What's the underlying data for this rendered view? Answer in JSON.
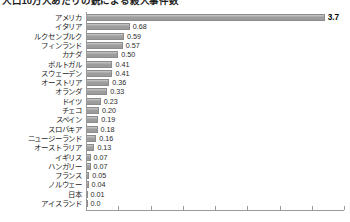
{
  "chart_data": {
    "type": "bar",
    "orientation": "horizontal",
    "title": "人口10万人あたりの銃による殺人事件数",
    "xlabel": "",
    "ylabel": "",
    "xlim": [
      0,
      4.0
    ],
    "grid": false,
    "legend": null,
    "axis_ticks": [
      "0.0",
      "0.5",
      "1.0",
      "1.5",
      "2.0",
      "2.5",
      "3.0",
      "3.5",
      "4.0"
    ],
    "highlight_category": "アメリカ",
    "bar_color": "#a3a3a3",
    "categories": [
      "アメリカ",
      "イタリア",
      "ルクセンブルク",
      "フィンランド",
      "カナダ",
      "ポルトガル",
      "スウェーデン",
      "オーストリア",
      "オランダ",
      "ドイツ",
      "チェコ",
      "スペイン",
      "スロバキア",
      "ニュージーランド",
      "オーストラリア",
      "イギリス",
      "ハンガリー",
      "フランス",
      "ノルウェー",
      "日本",
      "アイスランド"
    ],
    "values": [
      3.7,
      0.68,
      0.59,
      0.57,
      0.5,
      0.41,
      0.41,
      0.36,
      0.33,
      0.23,
      0.2,
      0.19,
      0.18,
      0.16,
      0.13,
      0.07,
      0.07,
      0.05,
      0.04,
      0.01,
      0.0
    ],
    "value_labels": [
      "3.7",
      "0.68",
      "0.59",
      "0.57",
      "0.50",
      "0.41",
      "0.41",
      "0.36",
      "0.33",
      "0.23",
      "0.20",
      "0.19",
      "0.18",
      "0.16",
      "0.13",
      "0.07",
      "0.07",
      "0.05",
      "0.04",
      "0.01",
      "0.0"
    ]
  }
}
